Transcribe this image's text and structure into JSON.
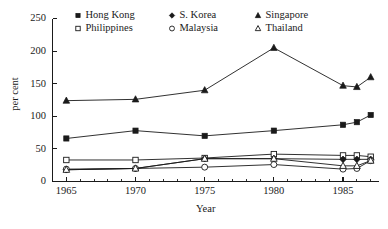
{
  "chart_data": {
    "type": "line",
    "title": "",
    "xlabel": "Year",
    "ylabel": "per cent",
    "x": [
      1965,
      1970,
      1975,
      1980,
      1985,
      1986,
      1987
    ],
    "xlim": [
      1964,
      1987.6
    ],
    "ylim": [
      0,
      250
    ],
    "xticks": [
      1965,
      1970,
      1975,
      1980,
      1985
    ],
    "xtick_labels": [
      "1965",
      "1970",
      "1975",
      "1980",
      "1985"
    ],
    "yticks": [
      0,
      50,
      100,
      150,
      200,
      250
    ],
    "ytick_labels": [
      "0",
      "50",
      "100",
      "150",
      "200",
      "250"
    ],
    "x_minor_tick_step": 1,
    "grid": false,
    "legend_position": "top-inside",
    "legend_columns": 3,
    "series": [
      {
        "name": "Hong Kong",
        "marker": "filled-square",
        "values": [
          66,
          78,
          70,
          78,
          87,
          91,
          102
        ]
      },
      {
        "name": "Philippines",
        "marker": "open-square",
        "values": [
          33,
          33,
          36,
          42,
          40,
          40,
          38
        ]
      },
      {
        "name": "S. Korea",
        "marker": "filled-diamond",
        "values": [
          18,
          20,
          35,
          35,
          34,
          34,
          34
        ]
      },
      {
        "name": "Malaysia",
        "marker": "open-circle",
        "values": [
          19,
          20,
          22,
          26,
          19,
          20,
          32
        ]
      },
      {
        "name": "Singapore",
        "marker": "filled-triangle",
        "values": [
          124,
          126,
          140,
          205,
          147,
          145,
          160
        ]
      },
      {
        "name": "Thailand",
        "marker": "open-triangle",
        "values": [
          18,
          20,
          35,
          35,
          24,
          24,
          32
        ]
      }
    ]
  },
  "axes": {
    "y_title": "per cent",
    "x_title": "Year"
  },
  "legend": {
    "entries": [
      {
        "label": "Hong Kong",
        "marker": "filled-square"
      },
      {
        "label": "S. Korea",
        "marker": "filled-diamond"
      },
      {
        "label": "Singapore",
        "marker": "filled-triangle"
      },
      {
        "label": "Philippines",
        "marker": "open-square"
      },
      {
        "label": "Malaysia",
        "marker": "open-circle"
      },
      {
        "label": "Thailand",
        "marker": "open-triangle"
      }
    ]
  },
  "colors": {
    "ink": "#1a1a1a",
    "background": "#ffffff"
  }
}
